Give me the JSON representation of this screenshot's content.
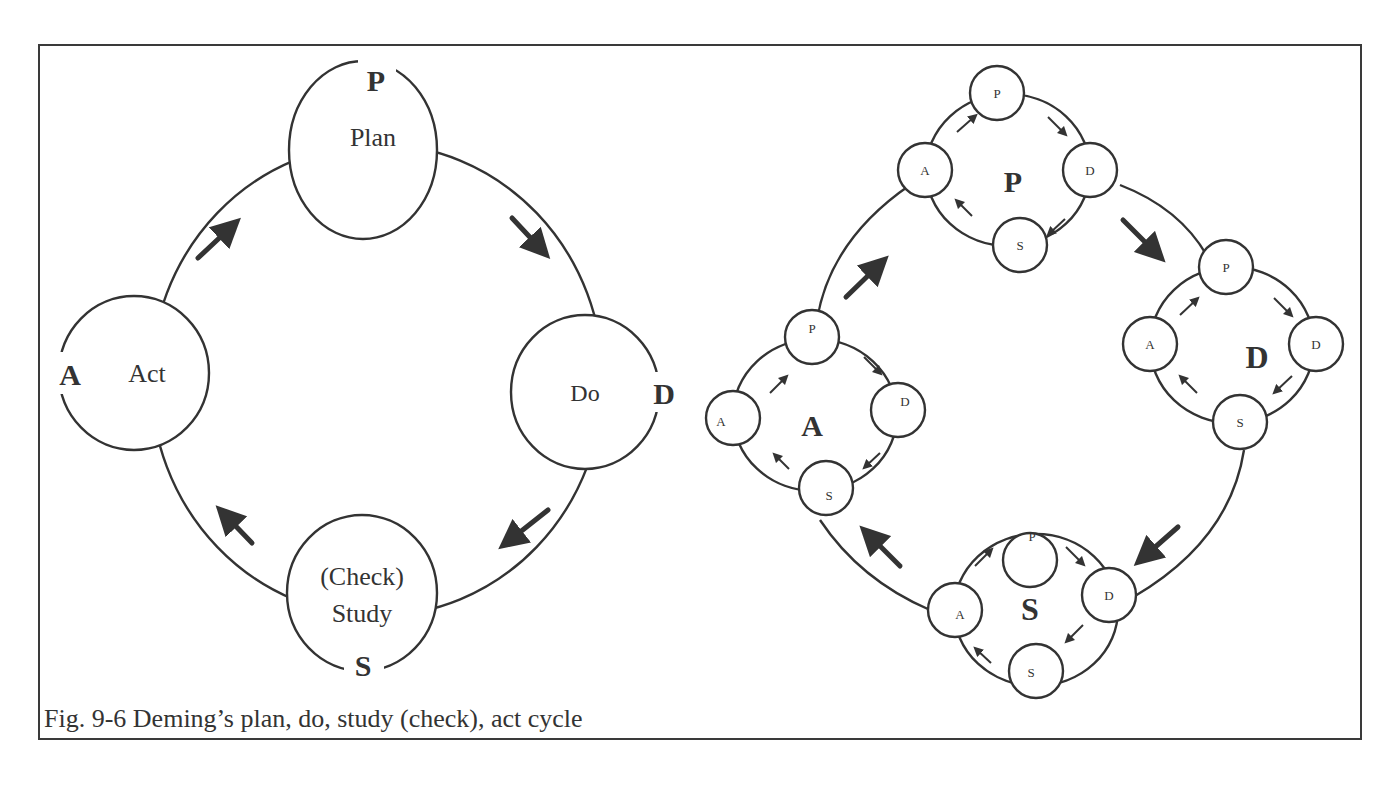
{
  "figure": {
    "caption": "Fig. 9-6 Deming’s plan, do, study (check), act cycle",
    "stroke_color": "#333333",
    "background": "#ffffff"
  },
  "left_cycle": {
    "nodes": [
      {
        "id": "plan",
        "letter": "P",
        "label": "Plan"
      },
      {
        "id": "do",
        "letter": "D",
        "label": "Do"
      },
      {
        "id": "study",
        "letter": "S",
        "label_line1": "(Check)",
        "label_line2": "Study"
      },
      {
        "id": "act",
        "letter": "A",
        "label": "Act"
      }
    ]
  },
  "right_cycle": {
    "clusters": [
      {
        "id": "p-cluster",
        "center_letter": "P",
        "sub": {
          "p": "P",
          "d": "D",
          "s": "S",
          "a": "A"
        }
      },
      {
        "id": "d-cluster",
        "center_letter": "D",
        "sub": {
          "p": "P",
          "d": "D",
          "s": "S",
          "a": "A"
        }
      },
      {
        "id": "s-cluster",
        "center_letter": "S",
        "sub": {
          "p": "P",
          "d": "D",
          "s": "S",
          "a": "A"
        }
      },
      {
        "id": "a-cluster",
        "center_letter": "A",
        "sub": {
          "p": "P",
          "d": "D",
          "s": "S",
          "a": "A"
        }
      }
    ]
  }
}
